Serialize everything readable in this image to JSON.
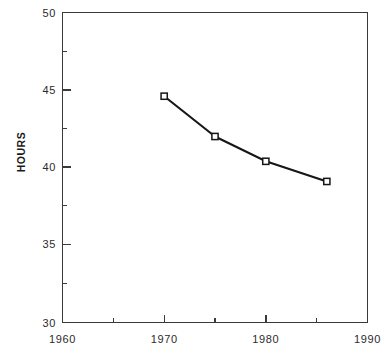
{
  "chart_data": {
    "type": "line",
    "title": "",
    "xlabel": "",
    "ylabel": "HOURS",
    "xlim": [
      1960,
      1990
    ],
    "ylim": [
      30,
      50
    ],
    "grid": false,
    "legend": null,
    "x_ticks_major": [
      1960,
      1970,
      1980,
      1990
    ],
    "x_tick_labels": [
      "1960",
      "1970",
      "1980",
      "1990"
    ],
    "x_ticks_minor": [
      1965,
      1975,
      1985
    ],
    "y_ticks_major": [
      30,
      35,
      40,
      45,
      50
    ],
    "y_tick_labels": [
      "30",
      "35",
      "40",
      "45",
      "50"
    ],
    "y_ticks_minor": [
      32.5,
      37.5,
      42.5,
      47.5
    ],
    "marker": "open-square",
    "line_color": "#161616",
    "marker_fill": "#ffffff",
    "series": [
      {
        "name": "HOURS",
        "x": [
          1970,
          1975,
          1980,
          1986
        ],
        "values": [
          44.6,
          42.0,
          40.4,
          39.1
        ]
      }
    ]
  },
  "axes": {
    "y_axis_title": "HOURS"
  }
}
